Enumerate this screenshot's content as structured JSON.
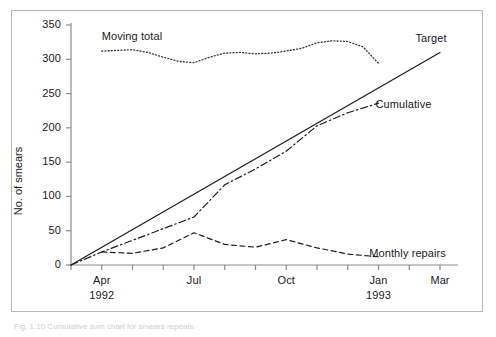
{
  "figure": {
    "caption": "Fig. 1.10  Cumulative sum chart for smears repeats",
    "frame_color": "#b9b9b9"
  },
  "chart_data": {
    "type": "line",
    "title": "",
    "xlabel": "",
    "ylabel": "No. of smears",
    "ylim": [
      0,
      350
    ],
    "yticks": [
      0,
      50,
      100,
      150,
      200,
      250,
      300,
      350
    ],
    "xlim": [
      0,
      12
    ],
    "xticks": [
      0,
      1,
      2,
      3,
      4,
      5,
      6,
      7,
      8,
      9,
      10,
      11,
      12
    ],
    "xtick_labels": [
      {
        "pos": 1,
        "label": "Apr",
        "sub": "1992"
      },
      {
        "pos": 4,
        "label": "Jul",
        "sub": ""
      },
      {
        "pos": 7,
        "label": "Oct",
        "sub": ""
      },
      {
        "pos": 10,
        "label": "Jan",
        "sub": "1993"
      },
      {
        "pos": 12,
        "label": "Mar",
        "sub": ""
      }
    ],
    "grid": false,
    "legend_position": "inline-annotations",
    "series": [
      {
        "name": "Moving total",
        "style": "dotted",
        "color": "#333333",
        "label_x": 1.0,
        "label_y": 333,
        "x": [
          1,
          1.5,
          2,
          2.5,
          3,
          3.5,
          4,
          4.5,
          5,
          5.5,
          6,
          6.5,
          7,
          7.5,
          8,
          8.5,
          9,
          9.5,
          10
        ],
        "values": [
          312,
          313,
          314,
          310,
          303,
          297,
          295,
          303,
          309,
          310,
          308,
          309,
          312,
          316,
          324,
          327,
          326,
          318,
          294
        ]
      },
      {
        "name": "Target",
        "style": "solid",
        "color": "#1a1a1a",
        "label_x": 11.2,
        "label_y": 330,
        "x": [
          0,
          12
        ],
        "values": [
          0,
          310
        ]
      },
      {
        "name": "Cumulative",
        "style": "dashdot",
        "color": "#1a1a1a",
        "label_x": 9.9,
        "label_y": 233,
        "x": [
          0,
          1,
          2,
          3,
          4,
          5,
          6,
          7,
          8,
          9,
          10
        ],
        "values": [
          0,
          19,
          36,
          53,
          70,
          117,
          140,
          166,
          203,
          222,
          236
        ]
      },
      {
        "name": "Monthly repairs",
        "style": "dashed",
        "color": "#1a1a1a",
        "label_x": 9.7,
        "label_y": 16,
        "x": [
          1,
          2,
          3,
          4,
          5,
          6,
          7,
          8,
          9,
          10
        ],
        "values": [
          19,
          17,
          25,
          47,
          30,
          26,
          37,
          25,
          16,
          12
        ]
      }
    ]
  }
}
